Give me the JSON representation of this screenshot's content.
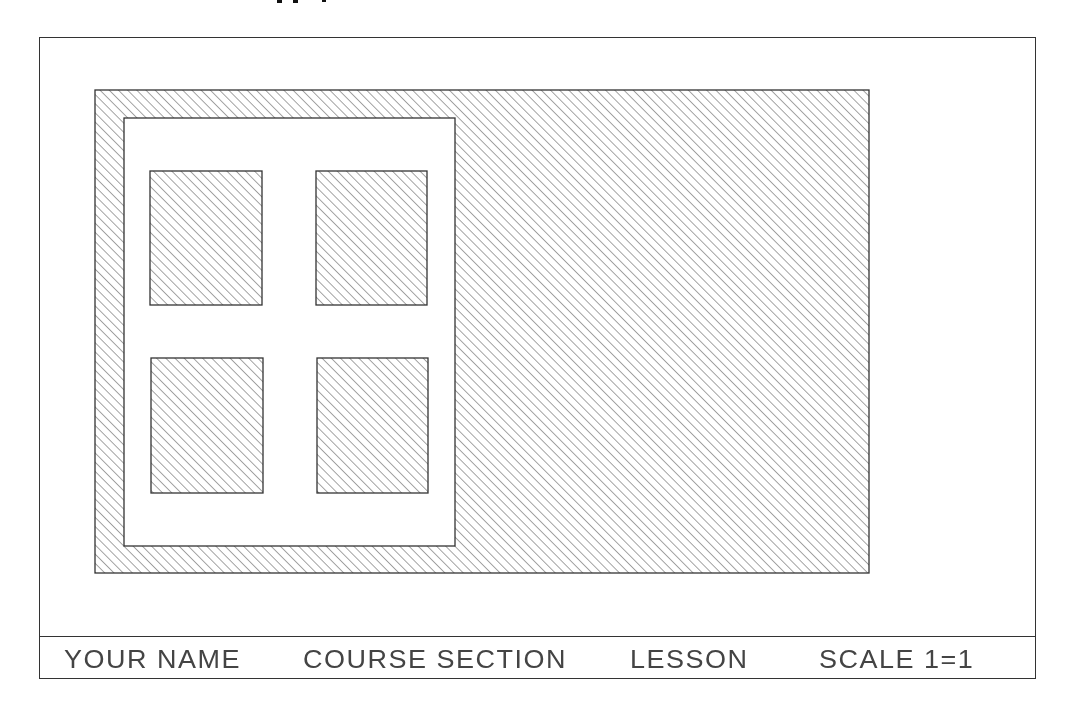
{
  "drawing": {
    "type": "hatched-section-drawing",
    "sheet_border": {
      "x": 39,
      "y": 37,
      "w": 997,
      "h": 642
    },
    "outer_hatched_region": {
      "x": 95,
      "y": 90,
      "w": 774,
      "h": 483
    },
    "inner_panel": {
      "x": 124,
      "y": 118,
      "w": 331,
      "h": 428
    },
    "openings": [
      {
        "name": "upper-left",
        "x": 150,
        "y": 171,
        "w": 112,
        "h": 134
      },
      {
        "name": "upper-right",
        "x": 316,
        "y": 171,
        "w": 111,
        "h": 134
      },
      {
        "name": "lower-left",
        "x": 151,
        "y": 358,
        "w": 112,
        "h": 135
      },
      {
        "name": "lower-right",
        "x": 317,
        "y": 358,
        "w": 111,
        "h": 135
      }
    ],
    "hatch": {
      "angle_deg": 45,
      "spacing_px": 6.5,
      "color": "#5a5a5a"
    },
    "line_color": "#333333"
  },
  "title_block": {
    "your_name": "YOUR NAME",
    "course_section": "COURSE SECTION",
    "lesson": "LESSON",
    "scale": "SCALE 1=1"
  }
}
